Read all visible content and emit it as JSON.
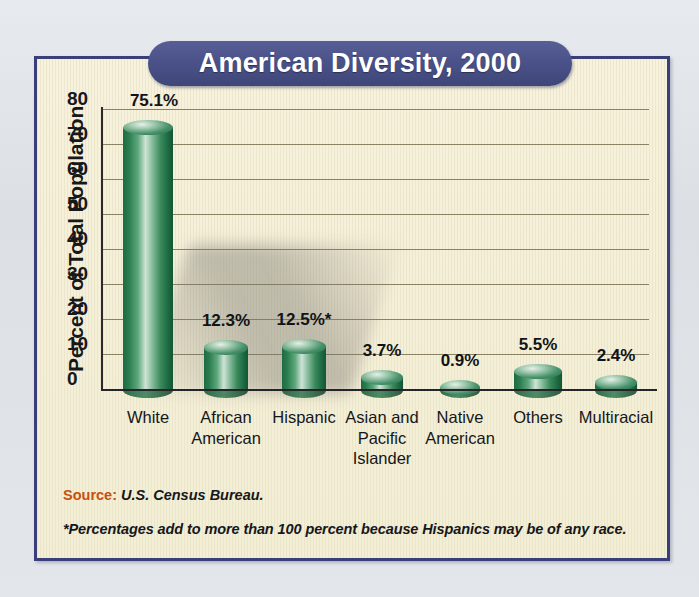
{
  "title": "American Diversity, 2000",
  "colors": {
    "title_band": "#4a5289",
    "frame_border": "#3b3f79",
    "paper": "#f6f1da",
    "bar_green": "#2f7b52",
    "gridline": "#8b8163",
    "source_label": "#c8500f",
    "page_background": "#dfe3e8"
  },
  "footer": {
    "source_label": "Source:",
    "source_value": "U.S. Census Bureau.",
    "footnote": "*Percentages add to more than 100 percent because Hispanics may be of any race."
  },
  "chart_data": {
    "type": "bar",
    "title": "American Diversity, 2000",
    "xlabel": "",
    "ylabel": "Percent of Total Population",
    "ylim": [
      0,
      80
    ],
    "yticks": [
      0,
      10,
      20,
      30,
      40,
      50,
      60,
      70,
      80
    ],
    "ytick_labels": [
      "0",
      "10",
      "20",
      "30",
      "40",
      "50",
      "60",
      "70",
      "80"
    ],
    "grid": true,
    "legend": "none",
    "categories": [
      "White",
      "African\nAmerican",
      "Hispanic",
      "Asian and\nPacific\nIslander",
      "Native\nAmerican",
      "Others",
      "Multiracial"
    ],
    "values": [
      75.1,
      12.3,
      12.5,
      3.7,
      0.9,
      5.5,
      2.4
    ],
    "value_labels": [
      "75.1%",
      "12.3%",
      "12.5%*",
      "3.7%",
      "0.9%",
      "5.5%",
      "2.4%"
    ],
    "annotations": [
      "*Percentages add to more than 100 percent because Hispanics may be of any race."
    ]
  }
}
